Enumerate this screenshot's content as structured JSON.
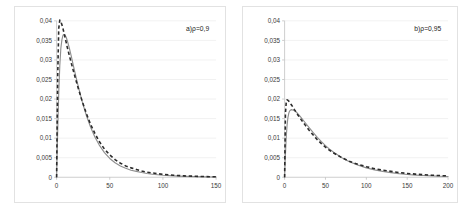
{
  "figure": {
    "background": "#ffffff",
    "panel_border_color": "#e2e2e2",
    "gridline_color": "#ededed",
    "solid_series_color": "#8f8f8f",
    "dashed_series_color": "#2b2b2b"
  },
  "chart_data": [
    {
      "type": "line",
      "title": "a)ρ=0,9",
      "panel_label": "a)ρ=0,9",
      "xlabel": "",
      "ylabel": "",
      "xlim": [
        0,
        150
      ],
      "ylim": [
        0,
        0.04
      ],
      "grid": true,
      "legend_position": "none",
      "xticks": [
        0,
        50,
        100,
        150
      ],
      "xtick_labels": [
        "0",
        "50",
        "100",
        "150"
      ],
      "yticks": [
        0,
        0.005,
        0.01,
        0.015,
        0.02,
        0.025,
        0.03,
        0.035,
        0.04
      ],
      "ytick_labels": [
        "0",
        "0,005",
        "0,01",
        "0,015",
        "0,02",
        "0,025",
        "0,03",
        "0,035",
        "0,04"
      ],
      "series": [
        {
          "name": "solid",
          "style": "solid",
          "color": "#8f8f8f",
          "x": [
            0,
            1,
            2,
            3,
            4,
            5,
            6,
            7,
            8,
            9,
            10,
            12,
            14,
            16,
            18,
            20,
            24,
            28,
            32,
            36,
            40,
            45,
            50,
            55,
            60,
            65,
            70,
            75,
            80,
            85,
            90,
            95,
            100,
            110,
            120,
            130,
            140,
            150
          ],
          "y": [
            0.0,
            0.0115,
            0.0215,
            0.0285,
            0.033,
            0.0352,
            0.0363,
            0.0365,
            0.0363,
            0.0358,
            0.035,
            0.033,
            0.0307,
            0.0283,
            0.0259,
            0.0236,
            0.0194,
            0.0158,
            0.0128,
            0.0103,
            0.0083,
            0.0063,
            0.0048,
            0.0037,
            0.0029,
            0.0023,
            0.0018,
            0.0015,
            0.0012,
            0.00095,
            0.00078,
            0.00064,
            0.00052,
            0.00035,
            0.00023,
            0.00015,
            0.0001,
            6e-05
          ]
        },
        {
          "name": "dashed",
          "style": "dashed",
          "color": "#2b2b2b",
          "x": [
            0,
            1,
            2,
            3,
            4,
            5,
            6,
            7,
            8,
            9,
            10,
            12,
            14,
            16,
            18,
            20,
            24,
            28,
            32,
            36,
            40,
            45,
            50,
            55,
            60,
            65,
            70,
            75,
            80,
            85,
            90,
            95,
            100,
            110,
            120,
            130,
            140,
            150
          ],
          "y": [
            0.0,
            0.0255,
            0.038,
            0.0402,
            0.0398,
            0.039,
            0.038,
            0.0369,
            0.0357,
            0.0345,
            0.0333,
            0.0311,
            0.029,
            0.027,
            0.025,
            0.0231,
            0.0195,
            0.0163,
            0.0135,
            0.0112,
            0.0092,
            0.0072,
            0.0057,
            0.0045,
            0.0036,
            0.0029,
            0.0024,
            0.002,
            0.0016,
            0.0013,
            0.0011,
            0.0009,
            0.00075,
            0.00052,
            0.00036,
            0.00025,
            0.00017,
            0.00012
          ]
        }
      ]
    },
    {
      "type": "line",
      "title": "b)ρ=0,95",
      "panel_label": "b)ρ=0,95",
      "xlabel": "",
      "ylabel": "",
      "xlim": [
        0,
        200
      ],
      "ylim": [
        0,
        0.04
      ],
      "grid": true,
      "legend_position": "none",
      "xticks": [
        0,
        50,
        100,
        150,
        200
      ],
      "xtick_labels": [
        "0",
        "50",
        "100",
        "150",
        "200"
      ],
      "yticks": [
        0,
        0.005,
        0.01,
        0.015,
        0.02,
        0.025,
        0.03,
        0.035,
        0.04
      ],
      "ytick_labels": [
        "0",
        "0,005",
        "0,01",
        "0,015",
        "0,02",
        "0,025",
        "0,03",
        "0,035",
        "0,04"
      ],
      "series": [
        {
          "name": "solid",
          "style": "solid",
          "color": "#8f8f8f",
          "x": [
            0,
            1,
            2,
            3,
            4,
            5,
            6,
            8,
            10,
            12,
            14,
            16,
            18,
            20,
            25,
            30,
            35,
            40,
            45,
            50,
            55,
            60,
            65,
            70,
            80,
            90,
            100,
            110,
            120,
            130,
            140,
            150,
            160,
            170,
            180,
            190,
            200
          ],
          "y": [
            0.0,
            0.0058,
            0.0103,
            0.0133,
            0.0152,
            0.0163,
            0.0169,
            0.0173,
            0.0172,
            0.017,
            0.0167,
            0.0163,
            0.0158,
            0.0153,
            0.014,
            0.0127,
            0.0114,
            0.0102,
            0.0091,
            0.0081,
            0.0072,
            0.0064,
            0.0057,
            0.005,
            0.0039,
            0.0031,
            0.0024,
            0.0019,
            0.0015,
            0.0012,
            0.00092,
            0.00072,
            0.00056,
            0.00044,
            0.00034,
            0.00026,
            0.0002
          ]
        },
        {
          "name": "dashed",
          "style": "dashed",
          "color": "#2b2b2b",
          "x": [
            0,
            1,
            2,
            3,
            4,
            5,
            6,
            8,
            10,
            12,
            14,
            16,
            18,
            20,
            25,
            30,
            35,
            40,
            45,
            50,
            55,
            60,
            65,
            70,
            80,
            90,
            100,
            110,
            120,
            130,
            140,
            150,
            160,
            170,
            180,
            190,
            200
          ],
          "y": [
            0.0,
            0.0163,
            0.0192,
            0.0198,
            0.0197,
            0.0195,
            0.0192,
            0.0186,
            0.018,
            0.0173,
            0.0167,
            0.016,
            0.0154,
            0.0148,
            0.0134,
            0.012,
            0.0108,
            0.0096,
            0.0086,
            0.0077,
            0.0069,
            0.0062,
            0.0056,
            0.005,
            0.004,
            0.0033,
            0.0027,
            0.0022,
            0.0018,
            0.0015,
            0.0012,
            0.00098,
            0.0008,
            0.00065,
            0.00053,
            0.00043,
            0.00035
          ]
        }
      ]
    }
  ]
}
